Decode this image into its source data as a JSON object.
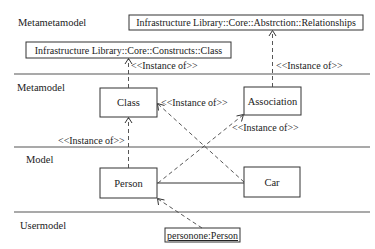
{
  "layers": {
    "metametamodel": "Metametamodel",
    "metamodel": "Metamodel",
    "model": "Model",
    "usermodel": "Usermodel"
  },
  "elements": {
    "relationships": "Infrastructure Library::Core::Abstrction::Relationships",
    "constructs_class": "Infrastructure Library::Core::Constructs::Class",
    "class": "Class",
    "association": "Association",
    "person": "Person",
    "car": "Car",
    "personone": "personone:Person"
  },
  "relations": {
    "instance_of": "<<Instance of>>"
  }
}
